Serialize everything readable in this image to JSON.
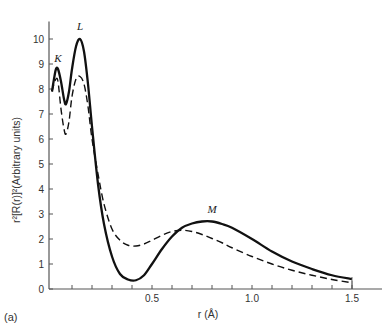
{
  "chart_data": {
    "type": "line",
    "title": "",
    "panel_label": "(a)",
    "xlabel": "r (Å)",
    "ylabel": "r²[R(r)]²(Arbitrary units)",
    "xlim": [
      0,
      1.65
    ],
    "ylim": [
      0,
      10.7
    ],
    "grid": false,
    "legend": null,
    "x_tick_labels": [
      {
        "value": 0.5,
        "label": "0.5"
      },
      {
        "value": 1.0,
        "label": "1.0"
      },
      {
        "value": 1.5,
        "label": "1.5"
      }
    ],
    "x_minor_ticks": [
      0.1,
      0.2,
      0.3,
      0.4,
      0.5,
      0.6,
      0.7,
      0.8,
      0.9,
      1.0,
      1.1,
      1.2,
      1.3,
      1.4,
      1.5
    ],
    "y_ticks": [
      0,
      1,
      2,
      3,
      4,
      5,
      6,
      7,
      8,
      9,
      10
    ],
    "annotations": [
      {
        "text": "K",
        "x": 0.03,
        "y": 9.1
      },
      {
        "text": "L",
        "x": 0.14,
        "y": 10.35
      },
      {
        "text": "M",
        "x": 0.8,
        "y": 3.05
      }
    ],
    "series": [
      {
        "name": "solid",
        "style": "solid",
        "x": [
          0.0,
          0.01,
          0.02,
          0.03,
          0.045,
          0.06,
          0.07,
          0.085,
          0.1,
          0.12,
          0.14,
          0.16,
          0.18,
          0.2,
          0.23,
          0.26,
          0.3,
          0.34,
          0.38,
          0.42,
          0.46,
          0.5,
          0.55,
          0.6,
          0.65,
          0.7,
          0.75,
          0.8,
          0.85,
          0.9,
          1.0,
          1.1,
          1.2,
          1.3,
          1.4,
          1.5
        ],
        "values": [
          7.9,
          8.4,
          8.8,
          8.8,
          8.3,
          7.6,
          7.4,
          7.9,
          8.8,
          9.7,
          10.0,
          9.5,
          8.2,
          6.5,
          4.2,
          2.6,
          1.3,
          0.6,
          0.38,
          0.35,
          0.55,
          1.0,
          1.6,
          2.1,
          2.45,
          2.62,
          2.7,
          2.7,
          2.6,
          2.45,
          2.0,
          1.5,
          1.1,
          0.8,
          0.55,
          0.4
        ]
      },
      {
        "name": "dashed",
        "style": "dashed",
        "x": [
          0.0,
          0.01,
          0.02,
          0.03,
          0.045,
          0.06,
          0.07,
          0.085,
          0.1,
          0.12,
          0.14,
          0.16,
          0.18,
          0.2,
          0.23,
          0.26,
          0.3,
          0.34,
          0.38,
          0.42,
          0.46,
          0.5,
          0.55,
          0.6,
          0.65,
          0.7,
          0.75,
          0.8,
          0.85,
          0.9,
          1.0,
          1.1,
          1.2,
          1.3,
          1.4,
          1.5
        ],
        "values": [
          7.9,
          8.2,
          8.4,
          8.3,
          7.2,
          6.4,
          6.2,
          6.7,
          7.7,
          8.4,
          8.5,
          8.2,
          7.3,
          6.0,
          4.6,
          3.4,
          2.4,
          1.95,
          1.75,
          1.72,
          1.8,
          1.95,
          2.15,
          2.3,
          2.35,
          2.3,
          2.18,
          2.02,
          1.85,
          1.65,
          1.3,
          1.0,
          0.75,
          0.55,
          0.38,
          0.25
        ]
      }
    ]
  }
}
